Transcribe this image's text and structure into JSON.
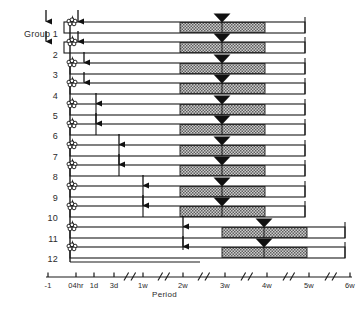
{
  "figure": {
    "axis_title": "Period",
    "bar_fill": "#ffffff",
    "bar_stroke": "#1a1a1a",
    "hatch_fill": "#b9b9b9",
    "marker_color": "#111111"
  },
  "group_labels": [
    {
      "text": "Group 1",
      "y": 32
    },
    {
      "text": "2",
      "y": 53
    },
    {
      "text": "3",
      "y": 73
    },
    {
      "text": "4",
      "y": 94
    },
    {
      "text": "5",
      "y": 114
    },
    {
      "text": "6",
      "y": 134
    },
    {
      "text": "7",
      "y": 155
    },
    {
      "text": "8",
      "y": 175
    },
    {
      "text": "9",
      "y": 196
    },
    {
      "text": "10",
      "y": 216
    },
    {
      "text": "11",
      "y": 237
    },
    {
      "text": "12",
      "y": 257
    }
  ],
  "axis": {
    "line_y": 277,
    "x_start": 46,
    "x_end": 352,
    "ticks": [
      {
        "label": "-1",
        "x": 48
      },
      {
        "label": "04hr",
        "x": 76
      },
      {
        "label": "1d",
        "x": 94
      },
      {
        "label": "3d",
        "x": 114
      },
      {
        "label": "1w",
        "x": 143
      },
      {
        "label": "2w",
        "x": 183
      },
      {
        "label": "3w",
        "x": 225
      },
      {
        "label": "4w",
        "x": 267
      },
      {
        "label": "5w",
        "x": 309
      },
      {
        "label": "6w",
        "x": 350
      }
    ],
    "breaks": [
      126,
      133,
      160,
      167,
      200,
      207,
      243,
      250,
      285,
      292,
      327,
      334
    ],
    "title_x": 152,
    "title_y": 290
  },
  "chart_data": {
    "type": "table",
    "title": "",
    "xlabel": "Period",
    "ylabel": "",
    "xticklabels": [
      "-1",
      "04hr",
      "1d",
      "3d",
      "1w",
      "2w",
      "3w",
      "4w",
      "5w",
      "6w"
    ],
    "categories": [
      "Group 1",
      "2",
      "3",
      "4",
      "5",
      "6",
      "7",
      "8",
      "9",
      "10",
      "11",
      "12"
    ],
    "bars": [
      {
        "group": "Group 1",
        "y": 22,
        "x0": 64,
        "x1": 305,
        "hatch_x0": 180,
        "hatch_x1": 265,
        "triangle_x": 222
      },
      {
        "group": "2",
        "y": 42,
        "x0": 64,
        "x1": 305,
        "hatch_x0": 180,
        "hatch_x1": 265,
        "triangle_x": 222
      },
      {
        "group": "3",
        "y": 63,
        "x0": 70,
        "x1": 305,
        "hatch_x0": 180,
        "hatch_x1": 265,
        "triangle_x": 222
      },
      {
        "group": "4",
        "y": 83,
        "x0": 70,
        "x1": 305,
        "hatch_x0": 180,
        "hatch_x1": 265,
        "triangle_x": 222
      },
      {
        "group": "5",
        "y": 104,
        "x0": 70,
        "x1": 305,
        "hatch_x0": 180,
        "hatch_x1": 265,
        "triangle_x": 222
      },
      {
        "group": "6",
        "y": 124,
        "x0": 70,
        "x1": 305,
        "hatch_x0": 180,
        "hatch_x1": 265,
        "triangle_x": 222
      },
      {
        "group": "7",
        "y": 145,
        "x0": 70,
        "x1": 305,
        "hatch_x0": 180,
        "hatch_x1": 265,
        "triangle_x": 222
      },
      {
        "group": "8",
        "y": 165,
        "x0": 70,
        "x1": 305,
        "hatch_x0": 180,
        "hatch_x1": 265,
        "triangle_x": 222
      },
      {
        "group": "9",
        "y": 186,
        "x0": 70,
        "x1": 305,
        "hatch_x0": 180,
        "hatch_x1": 265,
        "triangle_x": 222
      },
      {
        "group": "10",
        "y": 206,
        "x0": 70,
        "x1": 305,
        "hatch_x0": 180,
        "hatch_x1": 265,
        "triangle_x": 222
      },
      {
        "group": "11",
        "y": 227,
        "x0": 70,
        "x1": 345,
        "hatch_x0": 222,
        "hatch_x1": 307,
        "triangle_x": 264
      },
      {
        "group": "12",
        "y": 247,
        "x0": 70,
        "x1": 345,
        "hatch_x0": 222,
        "hatch_x1": 307,
        "triangle_x": 264
      }
    ],
    "bar_height": 11,
    "flower_markers": [
      {
        "x": 72,
        "y": 22
      },
      {
        "x": 72,
        "y": 42
      },
      {
        "x": 72,
        "y": 63
      },
      {
        "x": 72,
        "y": 83
      },
      {
        "x": 72,
        "y": 104
      },
      {
        "x": 72,
        "y": 124
      },
      {
        "x": 72,
        "y": 145
      },
      {
        "x": 72,
        "y": 165
      },
      {
        "x": 72,
        "y": 186
      },
      {
        "x": 72,
        "y": 206
      },
      {
        "x": 72,
        "y": 227
      },
      {
        "x": 72,
        "y": 247
      }
    ],
    "start_arrows": [
      {
        "x": 46,
        "y_from": 10,
        "y_to": 22
      },
      {
        "x": 46,
        "y_from": 31,
        "y_to": 42
      },
      {
        "x": 78,
        "y_from": 10,
        "y_to": 22
      },
      {
        "x": 78,
        "y_from": 31,
        "y_to": 42
      },
      {
        "x": 84,
        "y_from": 52,
        "y_to": 63
      },
      {
        "x": 84,
        "y_from": 72,
        "y_to": 83
      }
    ],
    "span_arrows": [
      {
        "x": 96,
        "y_from": 93,
        "y_to": 104
      },
      {
        "x": 96,
        "y_from": 113,
        "y_to": 124
      },
      {
        "x": 119,
        "y_from": 134,
        "y_to": 145
      },
      {
        "x": 119,
        "y_from": 154,
        "y_to": 165
      },
      {
        "x": 143,
        "y_from": 175,
        "y_to": 186
      },
      {
        "x": 143,
        "y_from": 195,
        "y_to": 206
      },
      {
        "x": 183,
        "y_from": 216,
        "y_to": 227
      },
      {
        "x": 183,
        "y_from": 236,
        "y_to": 247
      }
    ],
    "connector_lines": [
      {
        "x": 96,
        "y_from": 104,
        "y_to": 135
      },
      {
        "x": 119,
        "y_from": 145,
        "y_to": 176
      },
      {
        "x": 143,
        "y_from": 186,
        "y_to": 217
      },
      {
        "x": 183,
        "y_from": 227,
        "y_to": 250
      }
    ],
    "left_rail": {
      "x": 70,
      "y_from": 22,
      "y_to": 262
    }
  }
}
